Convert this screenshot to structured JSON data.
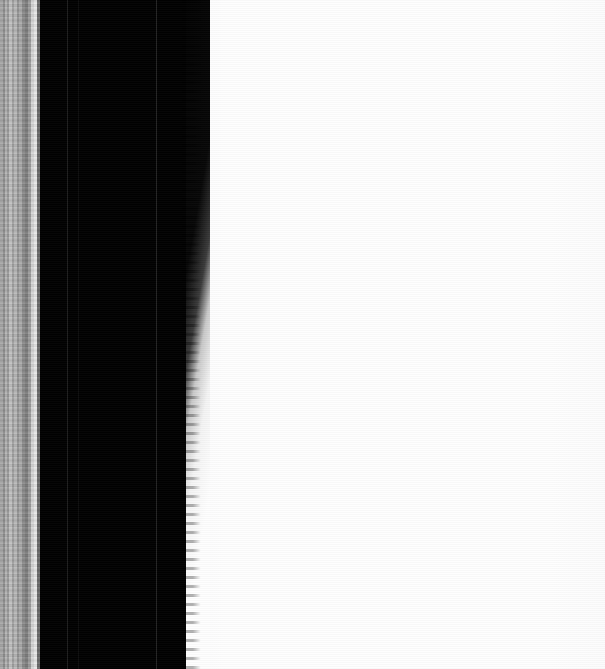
{
  "image": {
    "kind": "scan-edge-closeup",
    "width": 605,
    "height": 669,
    "caption": "",
    "background_color": "#fefefe"
  },
  "regions": {
    "left_band_strip": {
      "name": "left-band-strip",
      "x": 0,
      "width": 40,
      "description": "vertical gray gradient bands",
      "bands": [
        {
          "left": 0,
          "width": 3,
          "color": "#a8a8a8"
        },
        {
          "left": 3,
          "width": 2,
          "color": "#8e8e8e"
        },
        {
          "left": 5,
          "width": 2,
          "color": "#b4b4b4"
        },
        {
          "left": 7,
          "width": 2,
          "color": "#9a9a9a"
        },
        {
          "left": 9,
          "width": 3,
          "color": "#c2c2c2"
        },
        {
          "left": 12,
          "width": 2,
          "color": "#a0a0a0"
        },
        {
          "left": 14,
          "width": 3,
          "color": "#b8b8b8"
        },
        {
          "left": 17,
          "width": 2,
          "color": "#949494"
        },
        {
          "left": 19,
          "width": 3,
          "color": "#ababab"
        },
        {
          "left": 22,
          "width": 3,
          "color": "#8b8b8b"
        },
        {
          "left": 25,
          "width": 3,
          "color": "#7d7d7d"
        },
        {
          "left": 28,
          "width": 3,
          "color": "#9d9d9d"
        },
        {
          "left": 31,
          "width": 3,
          "color": "#d6d6d6"
        },
        {
          "left": 34,
          "width": 3,
          "color": "#e8e8e8"
        },
        {
          "left": 37,
          "width": 3,
          "color": "#6a6a6a"
        }
      ]
    },
    "dark_gutter": {
      "name": "dark-gutter-block",
      "x": 38,
      "width": 168,
      "color": "#010101",
      "seams": [
        {
          "name": "seam-a",
          "x": 67,
          "color": "#1d1d1d"
        },
        {
          "name": "seam-b",
          "x": 78,
          "color": "#0d0d0d"
        },
        {
          "name": "seam-c",
          "x": 156,
          "color": "#232323"
        }
      ]
    },
    "page_field": {
      "name": "white-page-field",
      "x": 203,
      "width": 402,
      "color": "#fefefe",
      "description": "blank white page surface"
    },
    "edge": {
      "name": "gutter-right-edge",
      "x_top": 205,
      "x_bottom": 196,
      "description": "jagged high-contrast boundary between dark gutter and white page"
    }
  }
}
